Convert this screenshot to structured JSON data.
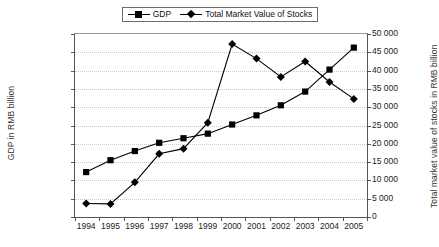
{
  "chart_data": {
    "type": "line",
    "title": "",
    "xlabel": "",
    "categories": [
      "1994",
      "1995",
      "1996",
      "1997",
      "1998",
      "1999",
      "2000",
      "2001",
      "2002",
      "2003",
      "2004",
      "2005"
    ],
    "grid": true,
    "legend_position": "top-center",
    "axes": {
      "left": {
        "label": "GDP in RMB billion",
        "min": 0,
        "max": 200000,
        "step": 20000,
        "ticks": [
          "0",
          "20 000",
          "40 000",
          "60 000",
          "80 000",
          "100 000",
          "120 000",
          "140 000",
          "160 000",
          "180 000",
          "200 000"
        ]
      },
      "right": {
        "label": "Total market value of stocks in RMB billion",
        "min": 0,
        "max": 50000,
        "step": 5000,
        "ticks": [
          "0",
          "5 000",
          "10 000",
          "15 000",
          "20 000",
          "25 000",
          "30 000",
          "35 000",
          "40 000",
          "45 000",
          "50 000"
        ]
      }
    },
    "series": [
      {
        "name": "GDP",
        "axis": "left",
        "marker": "square",
        "color": "#000000",
        "values": [
          48000,
          61000,
          71000,
          80000,
          85000,
          90000,
          100000,
          110000,
          121000,
          136000,
          160000,
          184000
        ]
      },
      {
        "name": "Total Market Value of Stocks",
        "axis": "right",
        "marker": "diamond",
        "color": "#000000",
        "values": [
          3400,
          3300,
          9200,
          17000,
          18400,
          25500,
          47000,
          43000,
          38000,
          42200,
          36600,
          32000
        ]
      }
    ]
  },
  "legend": {
    "entries": [
      {
        "label": "GDP",
        "marker": "square"
      },
      {
        "label": "Total Market Value of Stocks",
        "marker": "diamond"
      }
    ]
  }
}
